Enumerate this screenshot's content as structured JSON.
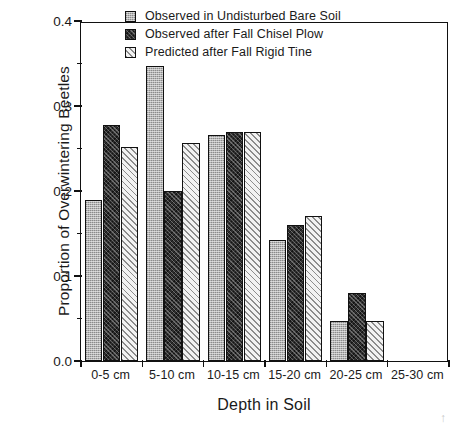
{
  "chart_data": {
    "type": "bar",
    "title": "",
    "xlabel": "Depth in Soil",
    "ylabel": "Proportion of Overwintering Beetles",
    "categories": [
      "0-5 cm",
      "5-10 cm",
      "10-15 cm",
      "15-20 cm",
      "20-25 cm",
      "25-30 cm"
    ],
    "series": [
      {
        "name": "Observed in Undisturbed Bare Soil",
        "fill": "light-gray-stipple",
        "values": [
          0.19,
          0.347,
          0.266,
          0.142,
          0.047,
          0.0
        ]
      },
      {
        "name": "Observed after Fall Chisel Plow",
        "fill": "dark-crosshatch",
        "values": [
          0.278,
          0.2,
          0.27,
          0.16,
          0.08,
          0.0
        ]
      },
      {
        "name": "Predicted after Fall Rigid Tine",
        "fill": "light-diagonal-hatch",
        "values": [
          0.252,
          0.256,
          0.27,
          0.171,
          0.047,
          0.0
        ]
      }
    ],
    "ylim": [
      0.0,
      0.4
    ],
    "ytick_labels": [
      "0.0",
      "0.1",
      "0.2",
      "0.3",
      "0.4"
    ],
    "ytick_values": [
      0.0,
      0.1,
      0.2,
      0.3,
      0.4
    ],
    "yminor_values": [
      0.05,
      0.15,
      0.25,
      0.35
    ],
    "grid": false,
    "legend_position": "top-center"
  },
  "legend": {
    "items": [
      {
        "label": "Observed in Undisturbed Bare Soil"
      },
      {
        "label": "Observed after Fall Chisel Plow"
      },
      {
        "label": "Predicted after Fall Rigid Tine"
      }
    ]
  },
  "axes": {
    "y_title": "Proportion of Overwintering Beetles",
    "x_title": "Depth in Soil"
  }
}
